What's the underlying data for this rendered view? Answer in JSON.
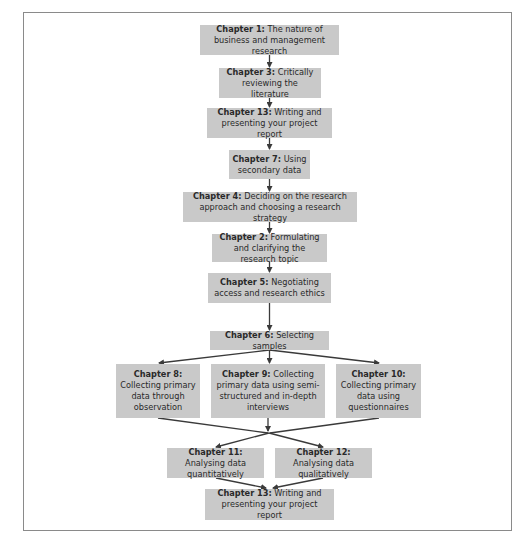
{
  "diagram": {
    "type": "flowchart",
    "node_fill": "#c9c9c9",
    "arrow_color": "#3a3a3a",
    "nodes": [
      {
        "id": "ch1",
        "chapter": "Chapter 1:",
        "text": "The nature of business and management research"
      },
      {
        "id": "ch3",
        "chapter": "Chapter 3:",
        "text": "Critically reviewing the literature"
      },
      {
        "id": "ch13a",
        "chapter": "Chapter 13:",
        "text": "Writing and presenting your project report"
      },
      {
        "id": "ch7",
        "chapter": "Chapter 7:",
        "text": "Using secondary data"
      },
      {
        "id": "ch4",
        "chapter": "Chapter 4:",
        "text": "Deciding on the research approach and choosing a research strategy"
      },
      {
        "id": "ch2",
        "chapter": "Chapter 2:",
        "text": "Formulating and clarifying the research topic"
      },
      {
        "id": "ch5",
        "chapter": "Chapter 5:",
        "text": "Negotiating access and research ethics"
      },
      {
        "id": "ch6",
        "chapter": "Chapter 6:",
        "text": "Selecting samples"
      },
      {
        "id": "ch8",
        "chapter": "Chapter 8:",
        "text": "Collecting primary data through observation"
      },
      {
        "id": "ch9",
        "chapter": "Chapter 9:",
        "text": "Collecting primary data using semi-structured and in-depth interviews"
      },
      {
        "id": "ch10",
        "chapter": "Chapter 10:",
        "text": "Collecting primary data using questionnaires"
      },
      {
        "id": "ch11",
        "chapter": "Chapter 11:",
        "text": "Analysing data quantitatively"
      },
      {
        "id": "ch12",
        "chapter": "Chapter 12:",
        "text": "Analysing data qualitatively"
      },
      {
        "id": "ch13b",
        "chapter": "Chapter 13:",
        "text": "Writing and presenting your project report"
      }
    ],
    "edges": [
      [
        "ch1",
        "ch3"
      ],
      [
        "ch3",
        "ch13a"
      ],
      [
        "ch13a",
        "ch7"
      ],
      [
        "ch7",
        "ch4"
      ],
      [
        "ch4",
        "ch2"
      ],
      [
        "ch2",
        "ch5"
      ],
      [
        "ch5",
        "ch6"
      ],
      [
        "ch6",
        "ch8"
      ],
      [
        "ch6",
        "ch9"
      ],
      [
        "ch6",
        "ch10"
      ],
      [
        "ch8",
        "ch11"
      ],
      [
        "ch8",
        "ch12"
      ],
      [
        "ch9",
        "ch11"
      ],
      [
        "ch9",
        "ch12"
      ],
      [
        "ch10",
        "ch11"
      ],
      [
        "ch10",
        "ch12"
      ],
      [
        "ch11",
        "ch13b"
      ],
      [
        "ch12",
        "ch13b"
      ]
    ]
  }
}
